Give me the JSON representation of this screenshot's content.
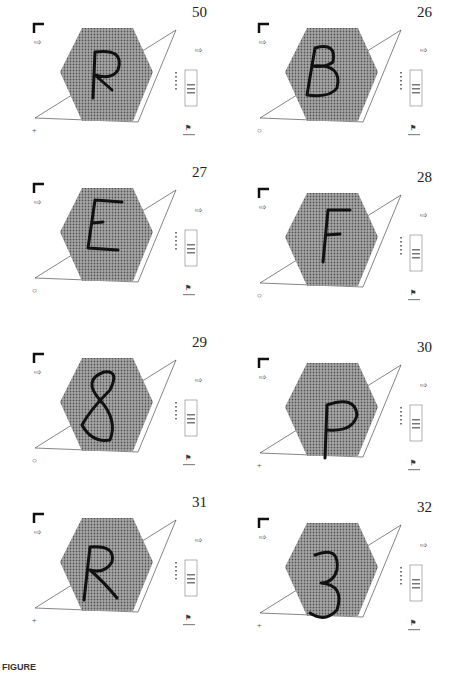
{
  "figure": {
    "caption": "FIGURE",
    "panels": [
      {
        "number": "50",
        "letter": "R",
        "corner_marker": "+",
        "x": 0,
        "y": 0
      },
      {
        "number": "26",
        "letter": "B",
        "corner_marker": "○",
        "x": 225,
        "y": 0
      },
      {
        "number": "27",
        "letter": "E",
        "corner_marker": "○",
        "x": 0,
        "y": 160
      },
      {
        "number": "28",
        "letter": "F",
        "corner_marker": "○",
        "x": 225,
        "y": 165
      },
      {
        "number": "29",
        "letter": "8",
        "corner_marker": "○",
        "x": 0,
        "y": 330
      },
      {
        "number": "30",
        "letter": "P",
        "corner_marker": "+",
        "x": 225,
        "y": 335
      },
      {
        "number": "31",
        "letter": "R",
        "corner_marker": "+",
        "x": 0,
        "y": 490
      },
      {
        "number": "32",
        "letter": "3",
        "corner_marker": "+",
        "x": 225,
        "y": 495
      }
    ]
  },
  "colors": {
    "hex_fill": "#8a8a8a",
    "line": "#333333",
    "ink": "#111111"
  }
}
